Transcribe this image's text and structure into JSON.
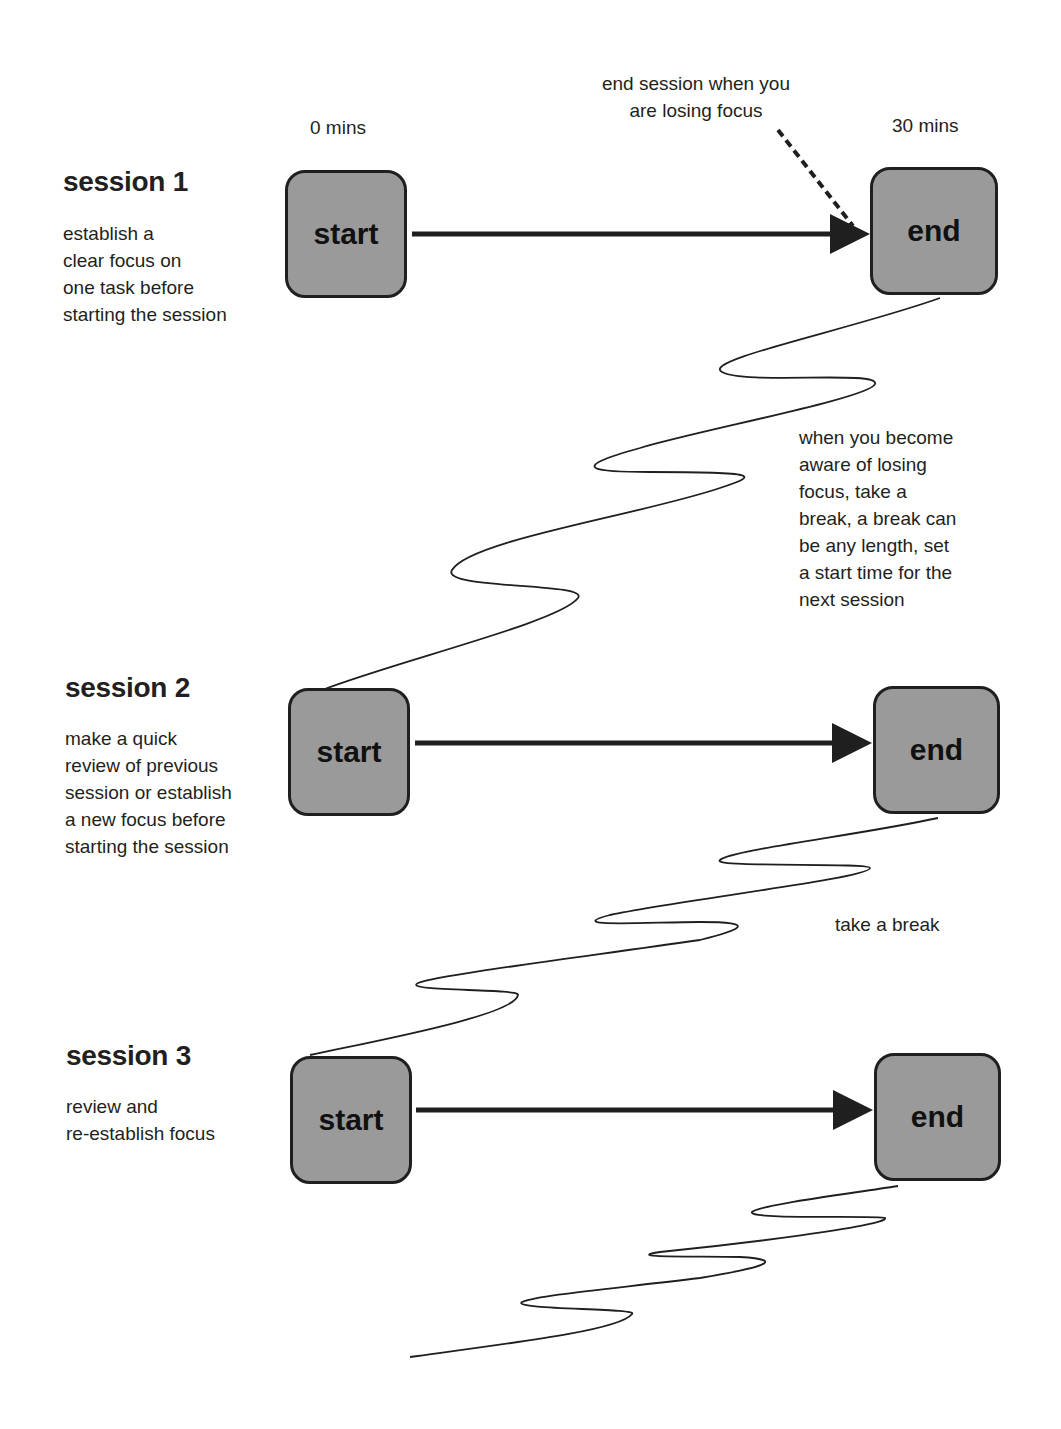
{
  "diagram": {
    "time_labels": {
      "start": "0 mins",
      "end": "30 mins"
    },
    "annotation_end_session": "end session when you\nare losing focus",
    "sessions": [
      {
        "heading": "session 1",
        "description": "establish a\nclear focus on\none task before\nstarting the session",
        "start_label": "start",
        "end_label": "end"
      },
      {
        "heading": "session 2",
        "description": "make a quick\nreview of previous\nsession or establish\na new focus before\nstarting the session",
        "start_label": "start",
        "end_label": "end"
      },
      {
        "heading": "session 3",
        "description": "review and\nre-establish focus",
        "start_label": "start",
        "end_label": "end"
      }
    ],
    "breaks": [
      {
        "text": "when you become\naware of losing\nfocus, take a\nbreak, a break can\nbe any length, set\na start time for the\nnext session"
      },
      {
        "text": "take a break"
      }
    ],
    "colors": {
      "box_fill": "#9a9a9a",
      "stroke": "#1f1f1f",
      "text": "#231f20"
    }
  }
}
